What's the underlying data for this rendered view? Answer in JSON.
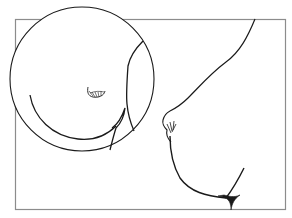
{
  "figure": {
    "kind": "line-illustration",
    "description": "Medical line drawing: side profile with magnified circular inset",
    "colors": {
      "background": "#ffffff",
      "ink": "#1a1a1a",
      "frame": "#8c8c8c"
    },
    "frame": {
      "x": 15,
      "y": 19,
      "width": 271,
      "height": 191
    },
    "inset": {
      "cx": 82,
      "cy": 79,
      "r": 72
    }
  }
}
